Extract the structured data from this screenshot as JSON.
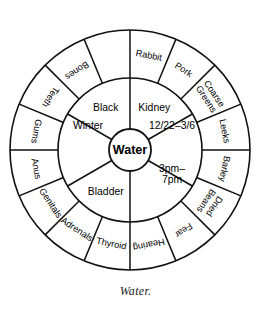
{
  "figure": {
    "caption": "Water.",
    "center_label": "Water"
  },
  "geometry": {
    "cx": 130,
    "cy": 150,
    "hub_radius": 21,
    "inner_radius": 72,
    "outer_radius": 120,
    "outer_segment_count": 16,
    "inner_segment_count": 6
  },
  "colors": {
    "stroke": "#111111",
    "background": "#ffffff",
    "text": "#000000"
  },
  "inner_ring": [
    {
      "label": "Winter",
      "angle": -60,
      "lines": [
        "Winter"
      ]
    },
    {
      "label": "Black",
      "angle": -30,
      "lines": [
        "Black"
      ]
    },
    {
      "label": "Kidney",
      "angle": 30,
      "lines": [
        "Kidney"
      ]
    },
    {
      "label": "12/22–3/6",
      "angle": 60,
      "lines": [
        "12/22–3/6"
      ]
    },
    {
      "label": "3pm–7pm",
      "angle": 120,
      "lines": [
        "3pm–",
        "7pm"
      ]
    },
    {
      "label": "Bladder",
      "angle": 210,
      "lines": [
        "Bladder"
      ]
    }
  ],
  "outer_ring": [
    {
      "label": "Rabbit",
      "lines": [
        "Rabbit"
      ]
    },
    {
      "label": "Pork",
      "lines": [
        "Pork"
      ]
    },
    {
      "label": "Coarse Greens",
      "lines": [
        "Coarse",
        "Greens"
      ]
    },
    {
      "label": "Leeks",
      "lines": [
        "Leeks"
      ]
    },
    {
      "label": "Barley",
      "lines": [
        "Barley"
      ]
    },
    {
      "label": "Dried Beans",
      "lines": [
        "Dried",
        "Beans"
      ]
    },
    {
      "label": "Fear",
      "lines": [
        "Fear"
      ]
    },
    {
      "label": "Hearing",
      "lines": [
        "Hearing"
      ]
    },
    {
      "label": "Thyroid",
      "lines": [
        "Thyroid"
      ]
    },
    {
      "label": "Adrenals",
      "lines": [
        "Adrenals"
      ]
    },
    {
      "label": "Genitals",
      "lines": [
        "Genitals"
      ]
    },
    {
      "label": "Anus",
      "lines": [
        "Anus"
      ]
    },
    {
      "label": "Gums",
      "lines": [
        "Gums"
      ]
    },
    {
      "label": "Teeth",
      "lines": [
        "Teeth"
      ]
    },
    {
      "label": "Bones",
      "lines": [
        "Bones"
      ]
    }
  ]
}
